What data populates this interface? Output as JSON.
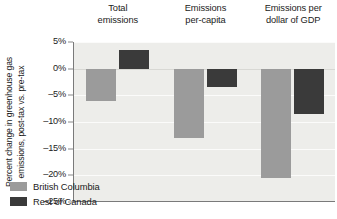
{
  "chart_data": {
    "type": "bar",
    "title": "",
    "subtitle": "",
    "xlabel": "",
    "ylabel": "Percent change in greenhouse gas emissions, post-tax vs. pre-tax",
    "categories": [
      "Total emissions",
      "Emissions per-capita",
      "Emissions per dollar of GDP"
    ],
    "series": [
      {
        "name": "British Columbia",
        "color": "#9b9b9b",
        "values": [
          -6.0,
          -13.0,
          -20.5
        ]
      },
      {
        "name": "Rest of Canada",
        "color": "#3a3a3a",
        "values": [
          3.5,
          -3.5,
          -8.5
        ]
      }
    ],
    "ylim": [
      -25,
      5
    ],
    "ytick_values": [
      5,
      0,
      -5,
      -10,
      -15,
      -20,
      -25
    ],
    "ytick_labels": [
      "5%",
      "0%",
      "–5%",
      "–10%",
      "–15%",
      "–20%",
      "–25%"
    ],
    "grid": true,
    "grid_axis": "y",
    "legend_position": "bottom-left-inside",
    "units": "percent",
    "annotations": []
  },
  "axis": {
    "y_title_line1": "Percent change in greenhouse gas",
    "y_title_line2": "emissions, post-tax vs. pre-tax"
  },
  "headers": [
    {
      "line1": "Total",
      "line2": "emissions"
    },
    {
      "line1": "Emissions",
      "line2": "per-capita"
    },
    {
      "line1": "Emissions per",
      "line2": "dollar of GDP"
    }
  ],
  "legend": {
    "items": [
      {
        "label": "British Columbia",
        "color": "#9b9b9b"
      },
      {
        "label": "Rest of Canada",
        "color": "#3a3a3a"
      }
    ]
  },
  "caption": {
    "text": ""
  },
  "colors": {
    "plot_background": "#ededea",
    "page_background": "#ffffff",
    "axis_line": "#7a7a7a",
    "gridline": "#fbfbfa",
    "text": "#1b1b1b",
    "series_bc": "#9b9b9b",
    "series_roc": "#3a3a3a"
  }
}
